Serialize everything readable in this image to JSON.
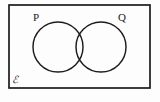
{
  "figure": {
    "kind": "venn-diagram",
    "caption": "",
    "background_color": "#fdfdfd",
    "stroke_color": "#1c1c1c"
  },
  "universe": {
    "label": "ℰ",
    "label_name": "universal-set-symbol",
    "description": "rectangle enclosing both sets",
    "x": 9,
    "y": 5,
    "width": 141,
    "height": 83,
    "label_x": 15,
    "label_y": 83
  },
  "sets": [
    {
      "id": "P",
      "label": "P",
      "cx": 58,
      "cy": 47,
      "r": 25,
      "label_x": 36,
      "label_y": 21
    },
    {
      "id": "Q",
      "label": "Q",
      "cx": 101,
      "cy": 47,
      "r": 25,
      "label_x": 122,
      "label_y": 21
    }
  ],
  "regions": {
    "intersection_label": "",
    "p_only_label": "",
    "q_only_label": "",
    "outside_label": ""
  }
}
